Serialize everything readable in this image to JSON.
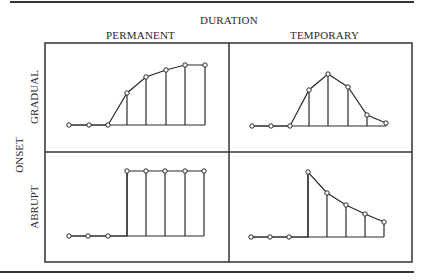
{
  "header": {
    "duration_label": "DURATION",
    "permanent_label": "PERMANENT",
    "temporary_label": "TEMPORARY"
  },
  "side": {
    "onset_label": "ONSET",
    "gradual_label": "GRADUAL",
    "abrupt_label": "ABRUPT"
  },
  "colors": {
    "line": "#2a2a2a",
    "background": "#ffffff"
  },
  "panels": [
    {
      "id": "gradual-permanent",
      "onset": "GRADUAL",
      "duration": "PERMANENT",
      "points": [
        [
          69,
          125
        ],
        [
          89,
          125
        ],
        [
          108,
          125
        ],
        [
          127,
          93
        ],
        [
          146,
          77
        ],
        [
          166,
          70
        ],
        [
          185,
          65
        ],
        [
          205,
          65
        ]
      ],
      "baseline": 125
    },
    {
      "id": "gradual-temporary",
      "onset": "GRADUAL",
      "duration": "TEMPORARY",
      "points": [
        [
          252,
          126
        ],
        [
          271,
          126
        ],
        [
          290,
          126
        ],
        [
          309,
          90
        ],
        [
          328,
          74
        ],
        [
          348,
          87
        ],
        [
          367,
          115
        ],
        [
          386,
          123
        ]
      ],
      "baseline": 126
    },
    {
      "id": "abrupt-permanent",
      "onset": "ABRUPT",
      "duration": "PERMANENT",
      "points": [
        [
          69,
          236
        ],
        [
          88,
          236
        ],
        [
          108,
          236
        ],
        [
          127,
          171
        ],
        [
          146,
          171
        ],
        [
          165,
          171
        ],
        [
          185,
          171
        ],
        [
          204,
          171
        ]
      ],
      "baseline": 236
    },
    {
      "id": "abrupt-temporary",
      "onset": "ABRUPT",
      "duration": "TEMPORARY",
      "points": [
        [
          251,
          237
        ],
        [
          270,
          237
        ],
        [
          289,
          237
        ],
        [
          308,
          172
        ],
        [
          327,
          193
        ],
        [
          346,
          205
        ],
        [
          365,
          214
        ],
        [
          384,
          222
        ]
      ],
      "baseline": 237
    }
  ]
}
